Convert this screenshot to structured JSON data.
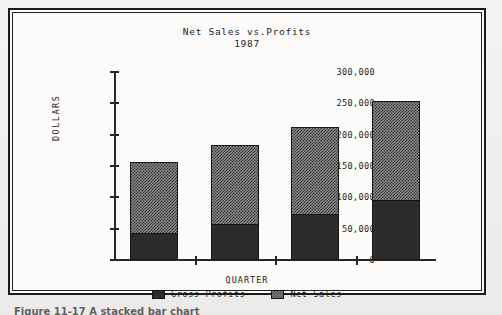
{
  "figure": {
    "caption_partial": "Figure 11-17   A stacked bar chart"
  },
  "chart_data": {
    "type": "bar",
    "subtype": "stacked-bar",
    "title": "Net Sales vs.Profits",
    "subtitle": "1987",
    "xlabel": "QUARTER",
    "ylabel": "DOLLARS",
    "grid": false,
    "legend_position": "bottom",
    "categories": [
      "1",
      "2",
      "3",
      "4"
    ],
    "ylim": [
      0,
      300000
    ],
    "ytick_labels": [
      "300,000",
      "250,000",
      "200,000",
      "150,000",
      "100,000",
      "50,000",
      "0"
    ],
    "ytick_values": [
      300000,
      250000,
      200000,
      150000,
      100000,
      50000,
      0
    ],
    "series": [
      {
        "name": "Gross Profits",
        "fill": "solid-dark",
        "color": "#2c2c2c",
        "values": [
          43000,
          57000,
          74000,
          95000
        ]
      },
      {
        "name": "Net Sales",
        "fill": "checker",
        "color": "#8d8d8d",
        "values": [
          157000,
          184000,
          212000,
          254000
        ]
      }
    ],
    "bars": [
      {
        "category": "1",
        "gross_profits": 43000,
        "net_sales": 157000
      },
      {
        "category": "2",
        "gross_profits": 57000,
        "net_sales": 184000
      },
      {
        "category": "3",
        "gross_profits": 74000,
        "net_sales": 212000
      },
      {
        "category": "4",
        "gross_profits": 95000,
        "net_sales": 254000
      }
    ]
  }
}
